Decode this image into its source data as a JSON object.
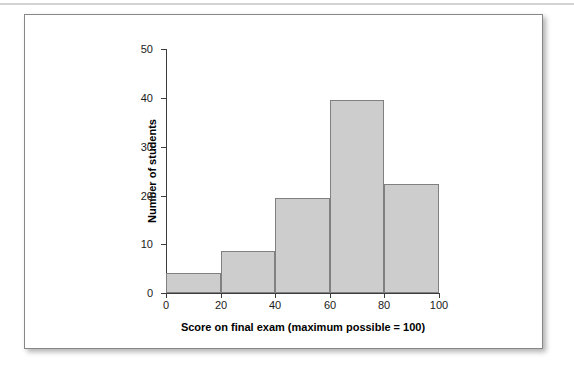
{
  "figure": {
    "background_color": "#ffffff",
    "border_color": "#878787",
    "rule_color": "#d3d3d3"
  },
  "chart_data": {
    "type": "bar",
    "title": "",
    "subtitle": "",
    "xlabel": "Score on final exam (maximum possible = 100)",
    "ylabel": "Number of students",
    "xlim": [
      0,
      100
    ],
    "ylim": [
      0,
      50
    ],
    "xticks": [
      0,
      20,
      40,
      60,
      80,
      100
    ],
    "yticks": [
      0,
      10,
      20,
      30,
      40,
      50
    ],
    "xtick_labels": [
      "0",
      "20",
      "40",
      "60",
      "80",
      "100"
    ],
    "ytick_labels": [
      "0",
      "10",
      "20",
      "30",
      "40",
      "50"
    ],
    "grid": false,
    "legend": false,
    "legend_position": "none",
    "bin_width": 20,
    "bin_edges": [
      0,
      20,
      40,
      60,
      80,
      100
    ],
    "categories": [
      "0-20",
      "20-40",
      "40-60",
      "60-80",
      "80-100"
    ],
    "values": [
      4,
      8.7,
      19.5,
      39.6,
      22.4
    ],
    "bar_fill_color": "#cdcdcd",
    "bar_border_color": "#808080",
    "axis_color": "#3c3c3c"
  }
}
